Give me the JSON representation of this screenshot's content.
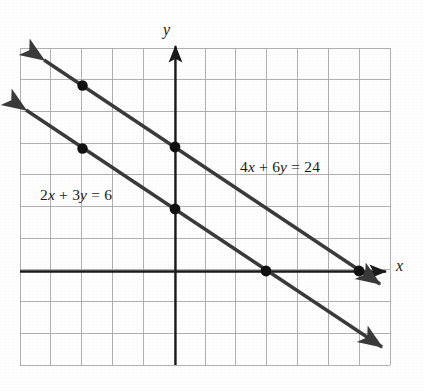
{
  "figure": {
    "type": "coordinate-graph",
    "background_color": "#fefefe",
    "grid_color": "#a8a8a8",
    "axis_color": "#1a1a1a",
    "line_color": "#3a3a3a",
    "point_color": "#111111"
  },
  "axes": {
    "x_label": "x",
    "y_label": "y",
    "origin_px": [
      175,
      272
    ],
    "unit_px": 31,
    "x_axis_has_arrow": true,
    "y_axis_has_arrow": true
  },
  "labels": {
    "equation_lower": "2x + 3y = 6",
    "equation_upper": "4x + 6y = 24"
  },
  "chart_data": {
    "type": "line",
    "title": "",
    "xlabel": "x",
    "ylabel": "y",
    "grid": true,
    "legend": "inline-annotations",
    "xlim": [
      -5,
      7
    ],
    "ylim": [
      -3,
      7.2
    ],
    "xticks": [
      -5,
      -4,
      -3,
      -2,
      -1,
      0,
      1,
      2,
      3,
      4,
      5,
      6,
      7
    ],
    "yticks": [
      -3,
      -2,
      -1,
      0,
      1,
      2,
      3,
      4,
      5,
      6,
      7
    ],
    "tick_labels_shown": false,
    "series": [
      {
        "name": "2x + 3y = 6",
        "equation": "2x + 3y = 6",
        "slope": -0.6667,
        "y_intercept": 2,
        "x_intercept": 3,
        "label_text": "2x + 3y = 6",
        "endpoints": [
          [
            -5,
            5.333
          ],
          [
            6.8,
            -2.533
          ]
        ],
        "arrows": "both",
        "marked_points": [
          [
            -3,
            4
          ],
          [
            0,
            2
          ],
          [
            3,
            0
          ]
        ]
      },
      {
        "name": "4x + 6y = 24",
        "equation": "4x + 6y = 24",
        "slope": -0.6667,
        "y_intercept": 4,
        "x_intercept": 6,
        "label_text": "4x + 6y = 24",
        "endpoints": [
          [
            -4.3,
            6.867
          ],
          [
            6.6,
            -0.4
          ]
        ],
        "arrows": "both",
        "marked_points": [
          [
            -3,
            6
          ],
          [
            0,
            4
          ],
          [
            6,
            0
          ]
        ]
      }
    ]
  }
}
